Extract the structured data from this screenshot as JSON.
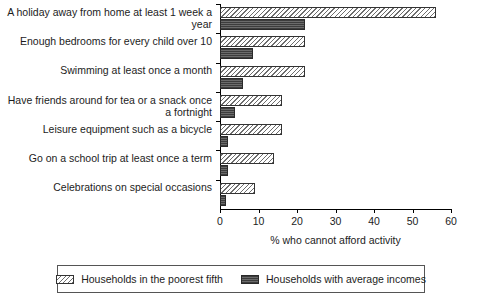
{
  "chart_data": {
    "type": "bar",
    "orientation": "horizontal",
    "title": "",
    "xlabel": "% who cannot afford activity",
    "ylabel": "",
    "xlim": [
      0,
      60
    ],
    "xticks": [
      0,
      10,
      20,
      30,
      40,
      50,
      60
    ],
    "grid": false,
    "legend_position": "bottom",
    "categories": [
      "A holiday away from home at least 1 week a year",
      "Enough bedrooms for every child over 10",
      "Swimming at least once a month",
      "Have friends around for tea or a snack once a fortnight",
      "Leisure equipment such as a bicycle",
      "Go on a school trip at least once a term",
      "Celebrations on special occasions"
    ],
    "series": [
      {
        "name": "Households in the poorest fifth",
        "pattern": "diagonal-hatch",
        "color": "#6e6e6e",
        "values": [
          56,
          22,
          22,
          16,
          16,
          14,
          9
        ]
      },
      {
        "name": "Households with average incomes",
        "pattern": "dark-dotted",
        "color": "#5b5b5b",
        "values": [
          22,
          8.5,
          6,
          4,
          2,
          2,
          1.5
        ]
      }
    ]
  },
  "legend": {
    "entries": [
      {
        "label": "Households in the poorest fifth"
      },
      {
        "label": "Households with average incomes"
      }
    ]
  }
}
